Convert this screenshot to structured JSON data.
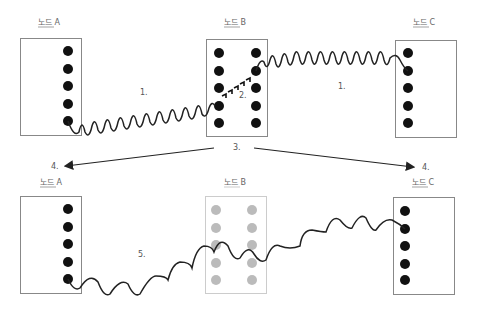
{
  "colors": {
    "box_stroke": "#888888",
    "box_faded_stroke": "#cccccc",
    "dot_active": "#111111",
    "dot_inactive": "#bbbbbb",
    "wave": "#222222",
    "arrow": "#222222",
    "label": "#555555"
  },
  "top_row": {
    "node_a": {
      "label": "노드 A",
      "state": "active"
    },
    "node_b": {
      "label": "노드 B",
      "state": "active"
    },
    "node_c": {
      "label": "노드 C",
      "state": "active"
    },
    "step_labels": {
      "link_ab": "1.",
      "forward_in_b": "2.",
      "link_bc": "1.",
      "b_notify": "3."
    }
  },
  "arrows": {
    "to_a": {
      "label": "4.",
      "icon": "arrow-left-icon"
    },
    "to_c": {
      "label": "4.",
      "icon": "arrow-right-icon"
    }
  },
  "bottom_row": {
    "node_a": {
      "label": "노드 A",
      "state": "active"
    },
    "node_b": {
      "label": "노드 B",
      "state": "inactive"
    },
    "node_c": {
      "label": "노드 C",
      "state": "active"
    },
    "step_labels": {
      "direct_link_ac": "5."
    }
  }
}
